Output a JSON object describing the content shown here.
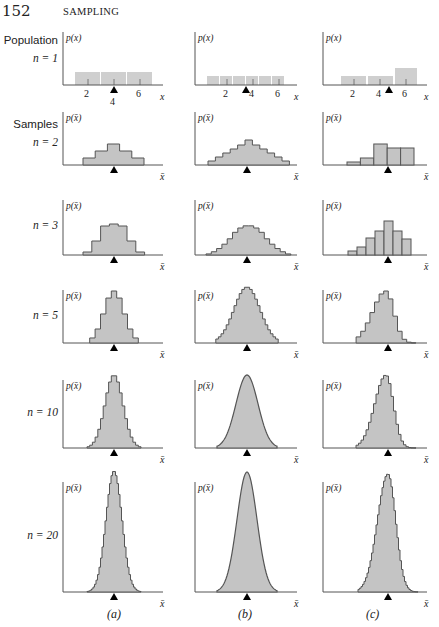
{
  "page": {
    "number": "152",
    "running_head": "SAMPLING"
  },
  "row_labels": [
    {
      "line1": "Population",
      "line2": "n = 1"
    },
    {
      "line1": "Samples",
      "line2": "n = 2"
    },
    {
      "line1": "",
      "line2": "n = 3"
    },
    {
      "line1": "",
      "line2": "n = 5"
    },
    {
      "line1": "",
      "line2": "n = 10"
    },
    {
      "line1": "",
      "line2": "n = 20"
    }
  ],
  "column_labels": [
    "(a)",
    "(b)",
    "(c)"
  ],
  "axis_labels": {
    "population_y": "p(x)",
    "sample_y": "p(x̄)",
    "population_x": "x",
    "sample_x": "x̄"
  },
  "population_ticks": [
    "2",
    "4",
    "6"
  ],
  "colors": {
    "fill": "#c4c4c4",
    "stroke": "#555555",
    "axis": "#555555",
    "mean_marker": "#000000",
    "pop_fill": "#cfcfcf"
  },
  "chart_data": {
    "type": "bar",
    "xlabel": "x̄",
    "ylabel": "p(x̄)",
    "grid": false,
    "panels": [
      {
        "column": "(a)",
        "row": "Population n = 1",
        "x": [
          1.5,
          3.5,
          5.5
        ],
        "bin_width": 2,
        "values": [
          1,
          1,
          1
        ],
        "mean": 4,
        "xticks": [
          2,
          4,
          6
        ]
      },
      {
        "column": "(b)",
        "row": "Population n = 1",
        "x": [
          1,
          2,
          3,
          4,
          5,
          6
        ],
        "values": [
          1,
          1,
          1,
          1,
          1,
          1
        ],
        "mean": 3.5,
        "xticks": [
          2,
          4,
          6
        ]
      },
      {
        "column": "(c)",
        "row": "Population n = 1",
        "x": [
          1.5,
          3.5,
          5.5
        ],
        "bin_width": 2,
        "values": [
          1,
          1,
          2
        ],
        "mean": 4.4,
        "xticks": [
          2,
          4,
          6
        ]
      },
      {
        "column": "(a)",
        "row": "n = 2",
        "shape": "stepped triangle",
        "values": [
          1,
          2,
          3,
          2,
          1
        ]
      },
      {
        "column": "(b)",
        "row": "n = 2",
        "shape": "stepped triangle",
        "values": [
          1,
          2,
          3,
          4,
          5,
          6,
          5,
          4,
          3,
          2,
          1
        ]
      },
      {
        "column": "(c)",
        "row": "n = 2",
        "shape": "skewed left bars",
        "values": [
          1,
          2,
          5,
          4,
          4
        ]
      },
      {
        "column": "(a)",
        "row": "n = 3",
        "values": [
          1,
          3,
          6,
          7,
          6,
          3,
          1
        ]
      },
      {
        "column": "(b)",
        "row": "n = 3",
        "values": [
          1,
          3,
          6,
          10,
          15,
          21,
          25,
          27,
          27,
          25,
          21,
          15,
          10,
          6,
          3,
          1
        ]
      },
      {
        "column": "(c)",
        "row": "n = 3",
        "values": [
          1,
          2,
          5,
          7,
          10,
          7,
          5
        ]
      },
      {
        "column": "(a)",
        "row": "n = 5",
        "shape": "stepped bell, narrower"
      },
      {
        "column": "(b)",
        "row": "n = 5",
        "shape": "near-smooth bell"
      },
      {
        "column": "(c)",
        "row": "n = 5",
        "shape": "stepped bell, slight left skew"
      },
      {
        "column": "(a)",
        "row": "n = 10",
        "shape": "stepped bell"
      },
      {
        "column": "(b)",
        "row": "n = 10",
        "shape": "smooth bell"
      },
      {
        "column": "(c)",
        "row": "n = 10",
        "shape": "stepped bell, slight left skew"
      },
      {
        "column": "(a)",
        "row": "n = 20",
        "shape": "tall narrow bell"
      },
      {
        "column": "(b)",
        "row": "n = 20",
        "shape": "smooth normal curve"
      },
      {
        "column": "(c)",
        "row": "n = 20",
        "shape": "tall stepped bell"
      }
    ]
  }
}
